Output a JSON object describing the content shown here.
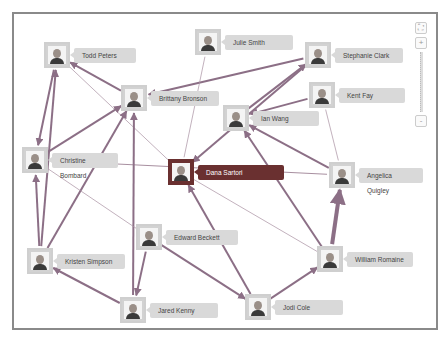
{
  "graph": {
    "nodes": [
      {
        "id": "todd",
        "name": "Todd Peters",
        "x": 57,
        "y": 55,
        "lw": 62
      },
      {
        "id": "julie",
        "name": "Julie Smith",
        "x": 208,
        "y": 42,
        "lw": 68
      },
      {
        "id": "stephanie",
        "name": "Stephanie Clark",
        "x": 318,
        "y": 55,
        "lw": 68
      },
      {
        "id": "brittany",
        "name": "Brittany Bronson",
        "x": 134,
        "y": 98,
        "lw": 68
      },
      {
        "id": "kent",
        "name": "Kent Fay",
        "x": 322,
        "y": 95,
        "lw": 66
      },
      {
        "id": "ian",
        "name": "Ian Wang",
        "x": 236,
        "y": 118,
        "lw": 66
      },
      {
        "id": "christine",
        "name": "Christine Bombard",
        "x": 35,
        "y": 160,
        "lw": 66
      },
      {
        "id": "dana",
        "name": "Dana Sartori",
        "x": 181,
        "y": 172,
        "lw": 86,
        "selected": true
      },
      {
        "id": "angelica",
        "name": "Angelica Quigley",
        "x": 342,
        "y": 175,
        "lw": 64
      },
      {
        "id": "edward",
        "name": "Edward Beckett",
        "x": 149,
        "y": 237,
        "lw": 72
      },
      {
        "id": "kristen",
        "name": "Kristen Simpson",
        "x": 40,
        "y": 261,
        "lw": 68
      },
      {
        "id": "william",
        "name": "William Romaine",
        "x": 330,
        "y": 259,
        "lw": 66
      },
      {
        "id": "jared",
        "name": "Jared Kenny",
        "x": 133,
        "y": 310,
        "lw": 68
      },
      {
        "id": "jodi",
        "name": "Jodi Cole",
        "x": 258,
        "y": 307,
        "lw": 68
      }
    ],
    "edges": [
      {
        "from": "brittany",
        "to": "todd",
        "w": 2
      },
      {
        "from": "todd",
        "to": "christine",
        "w": 2
      },
      {
        "from": "todd",
        "to": "dana",
        "w": 0.7
      },
      {
        "from": "stephanie",
        "to": "brittany",
        "w": 2
      },
      {
        "from": "julie",
        "to": "dana",
        "w": 0.7
      },
      {
        "from": "ian",
        "to": "stephanie",
        "w": 2
      },
      {
        "from": "kent",
        "to": "ian",
        "w": 2
      },
      {
        "from": "kent",
        "to": "angelica",
        "w": 0.7
      },
      {
        "from": "stephanie",
        "to": "dana",
        "w": 2
      },
      {
        "from": "christine",
        "to": "brittany",
        "w": 2
      },
      {
        "from": "christine",
        "to": "angelica",
        "w": 1
      },
      {
        "from": "angelica",
        "to": "ian",
        "w": 2
      },
      {
        "from": "william",
        "to": "ian",
        "w": 2
      },
      {
        "from": "dana",
        "to": "william",
        "w": 0.7
      },
      {
        "from": "william",
        "to": "angelica",
        "w": 4
      },
      {
        "from": "kristen",
        "to": "christine",
        "w": 2
      },
      {
        "from": "kristen",
        "to": "todd",
        "w": 2
      },
      {
        "from": "kristen",
        "to": "brittany",
        "w": 2
      },
      {
        "from": "jared",
        "to": "brittany",
        "w": 2
      },
      {
        "from": "jared",
        "to": "kristen",
        "w": 2
      },
      {
        "from": "edward",
        "to": "jared",
        "w": 2
      },
      {
        "from": "edward",
        "to": "jodi",
        "w": 2
      },
      {
        "from": "christine",
        "to": "edward",
        "w": 0.7
      },
      {
        "from": "jodi",
        "to": "dana",
        "w": 2
      },
      {
        "from": "jodi",
        "to": "william",
        "w": 2
      }
    ],
    "edge_color": "#8c6f86",
    "selected_color": "#6a3030"
  },
  "controls": {
    "fit_label": "⛶",
    "zoom_in_label": "+",
    "zoom_out_label": "-"
  }
}
